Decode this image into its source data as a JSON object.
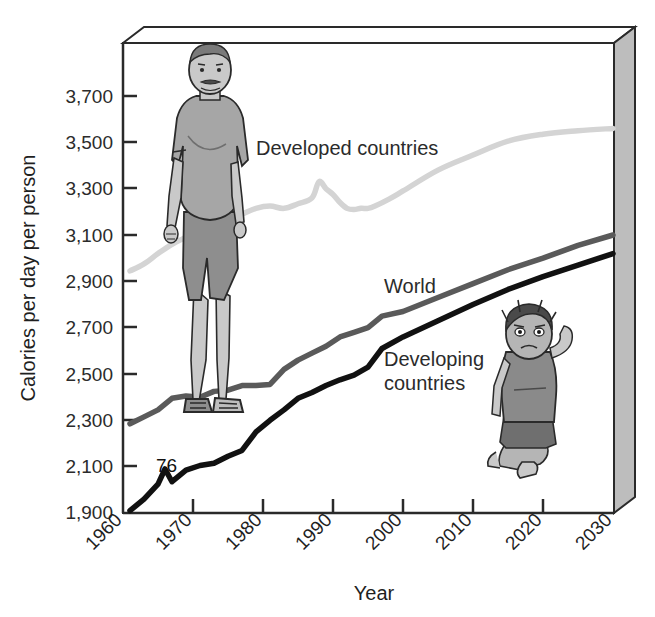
{
  "chart_data": {
    "type": "line",
    "title": "",
    "xlabel": "Year",
    "ylabel": "Calories per day per person",
    "xlim": [
      1960,
      2030
    ],
    "ylim": [
      1900,
      3800
    ],
    "grid": false,
    "legend": "inline-labels",
    "x_ticks": [
      "1960",
      "1970",
      "1980",
      "1990",
      "2000",
      "2010",
      "2020",
      "2030"
    ],
    "y_ticks": [
      "1,900",
      "2,100",
      "2,300",
      "2,500",
      "2,700",
      "2,900",
      "3,100",
      "3,300",
      "3,500",
      "3,700"
    ],
    "annotations": [
      {
        "text": "76",
        "x": 1967,
        "y": 2130
      }
    ],
    "series": [
      {
        "name": "Developed countries",
        "color": "#d4d4d4",
        "label_x": 1982,
        "label_y": 3470,
        "x": [
          1961,
          1963,
          1965,
          1967,
          1969,
          1971,
          1973,
          1975,
          1977,
          1979,
          1981,
          1983,
          1985,
          1987,
          1988,
          1989,
          1990,
          1991,
          1992,
          1993,
          1994,
          1995,
          1996,
          1998,
          2000,
          2005,
          2010,
          2015,
          2020,
          2025,
          2030
        ],
        "values": [
          2945,
          2975,
          3020,
          3060,
          3090,
          3120,
          3145,
          3165,
          3190,
          3215,
          3225,
          3215,
          3235,
          3260,
          3330,
          3300,
          3275,
          3240,
          3215,
          3210,
          3215,
          3215,
          3225,
          3255,
          3290,
          3380,
          3445,
          3505,
          3535,
          3550,
          3560
        ]
      },
      {
        "name": "World",
        "color": "#5a5a5a",
        "label_x": 1996,
        "label_y": 2830,
        "x": [
          1961,
          1963,
          1965,
          1967,
          1969,
          1971,
          1973,
          1975,
          1977,
          1979,
          1981,
          1983,
          1985,
          1987,
          1989,
          1991,
          1993,
          1995,
          1997,
          2000,
          2005,
          2010,
          2015,
          2020,
          2025,
          2030
        ],
        "values": [
          2285,
          2315,
          2345,
          2395,
          2405,
          2400,
          2425,
          2430,
          2450,
          2450,
          2455,
          2520,
          2560,
          2590,
          2620,
          2660,
          2680,
          2700,
          2750,
          2770,
          2830,
          2890,
          2950,
          3000,
          3055,
          3100
        ]
      },
      {
        "name": "Developing countries",
        "color": "#111111",
        "label_x": 2001,
        "label_y": 2585,
        "x": [
          1961,
          1963,
          1965,
          1966,
          1967,
          1969,
          1971,
          1973,
          1975,
          1977,
          1979,
          1981,
          1983,
          1985,
          1987,
          1989,
          1991,
          1993,
          1995,
          1997,
          2000,
          2005,
          2010,
          2015,
          2020,
          2025,
          2030
        ],
        "values": [
          1910,
          1960,
          2025,
          2090,
          2035,
          2085,
          2105,
          2115,
          2145,
          2170,
          2250,
          2300,
          2345,
          2395,
          2420,
          2450,
          2475,
          2495,
          2530,
          2610,
          2660,
          2730,
          2800,
          2865,
          2920,
          2970,
          3020
        ]
      }
    ]
  },
  "illustrations": [
    {
      "name": "overweight-man-figure",
      "description": "Overweight man standing"
    },
    {
      "name": "malnourished-child-figure",
      "description": "Malnourished child sitting"
    }
  ]
}
